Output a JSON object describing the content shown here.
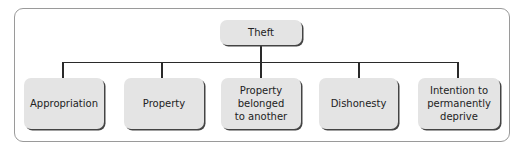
{
  "diagram": {
    "type": "hierarchy",
    "root": {
      "label": "Theft"
    },
    "children": [
      {
        "label": "Appropriation"
      },
      {
        "label": "Property"
      },
      {
        "label": "Property belonged to another"
      },
      {
        "label": "Dishonesty"
      },
      {
        "label": "Intention to permanently deprive"
      }
    ]
  },
  "colors": {
    "node_fill": "#e4e4e4",
    "node_shadow": "#444444",
    "connector": "#2a2a2a",
    "frame_border": "#9a9a9a"
  }
}
